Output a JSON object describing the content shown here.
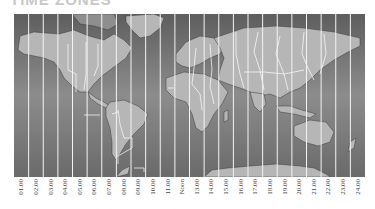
{
  "title": "TIME ZONES",
  "map": {
    "ocean_color": "#6e6e6e",
    "ocean_light": "#8a8a8a",
    "land_color": "#b4b4b4",
    "border_color": "#ffffff",
    "zone_line_color": "#f2f2f2"
  },
  "zones": {
    "labels": [
      "01.00",
      "02.00",
      "03.00",
      "04.00",
      "05.00",
      "06.00",
      "07.00",
      "08.00",
      "09.00",
      "10.00",
      "11.00",
      "Noon",
      "13.00",
      "14.00",
      "15.00",
      "16.00",
      "17.00",
      "18.00",
      "19.00",
      "20.00",
      "21.00",
      "22.00",
      "23.00",
      "24.00"
    ]
  }
}
